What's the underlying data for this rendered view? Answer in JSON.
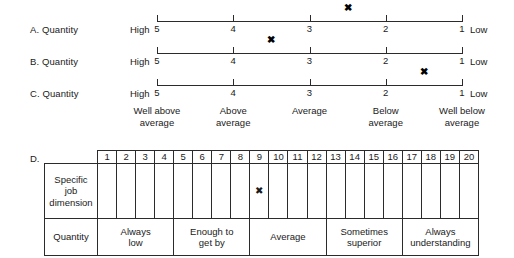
{
  "scales": {
    "anchor_left": "High",
    "anchor_right": "Low",
    "tick_values": [
      "5",
      "4",
      "3",
      "2",
      "1"
    ],
    "rows": [
      {
        "label": "A. Quantity",
        "mark": "✖",
        "mark_value": 2.5
      },
      {
        "label": "B. Quantity",
        "mark": "✖",
        "mark_value": 3.5
      },
      {
        "label": "C. Quantity",
        "mark": "✖",
        "mark_value": 1.5
      }
    ],
    "descriptors": [
      {
        "line1": "Well above",
        "line2": "average"
      },
      {
        "line1": "Above",
        "line2": "average"
      },
      {
        "line1": "Average",
        "line2": ""
      },
      {
        "line1": "Below",
        "line2": "average"
      },
      {
        "line1": "Well below",
        "line2": "average"
      }
    ]
  },
  "section_d": {
    "letter": "D.",
    "corner_label": "",
    "column_numbers": [
      "1",
      "2",
      "3",
      "4",
      "5",
      "6",
      "7",
      "8",
      "9",
      "10",
      "11",
      "12",
      "13",
      "14",
      "15",
      "16",
      "17",
      "18",
      "19",
      "20"
    ],
    "dimension_row": {
      "label_line1": "Specific",
      "label_line2": "job",
      "label_line3": "dimension",
      "mark": "✖",
      "mark_column": 9
    },
    "category_row": {
      "label": "Quantity",
      "groups": [
        {
          "line1": "Always",
          "line2": "low",
          "span": 4
        },
        {
          "line1": "Enough to",
          "line2": "get by",
          "span": 4
        },
        {
          "line1": "Average",
          "line2": "",
          "span": 4
        },
        {
          "line1": "Sometimes",
          "line2": "superior",
          "span": 4
        },
        {
          "line1": "Always",
          "line2": "understanding",
          "span": 4
        }
      ]
    }
  },
  "colors": {
    "ink": "#2b2b2b",
    "background": "#ffffff"
  }
}
